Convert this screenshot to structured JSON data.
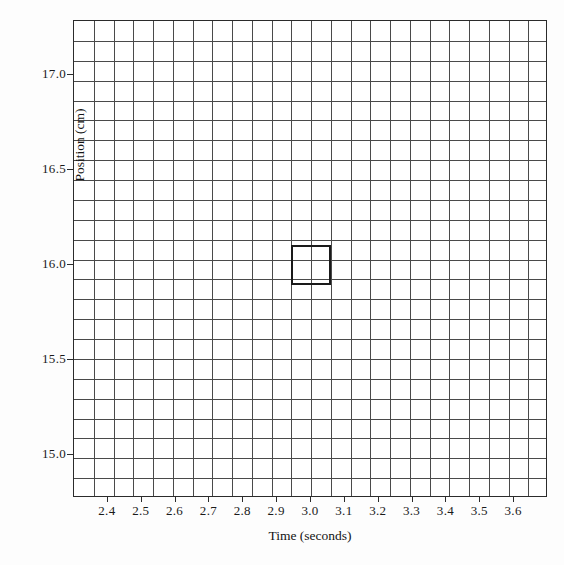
{
  "chart_data": {
    "type": "scatter",
    "title": "",
    "xlabel": "Time (seconds)",
    "ylabel": "Position (cm)",
    "xlim": [
      2.3,
      3.7
    ],
    "ylim": [
      14.775,
      17.285
    ],
    "xticks": [
      "2.4",
      "2.5",
      "2.6",
      "2.7",
      "2.8",
      "2.9",
      "3.0",
      "3.1",
      "3.2",
      "3.3",
      "3.4",
      "3.5",
      "3.6"
    ],
    "xtick_values": [
      2.4,
      2.5,
      2.6,
      2.7,
      2.8,
      2.9,
      3.0,
      3.1,
      3.2,
      3.3,
      3.4,
      3.5,
      3.6
    ],
    "yticks": [
      "15.0",
      "15.5",
      "16.0",
      "16.5",
      "17.0"
    ],
    "ytick_values": [
      15.0,
      15.5,
      16.0,
      16.5,
      17.0
    ],
    "grid": true,
    "grid_columns": 24,
    "grid_rows": 24,
    "grid_cell_width_seconds": 0.0583,
    "grid_cell_height_cm": 0.1046,
    "legend": null,
    "series": [
      {
        "name": "highlighted cell",
        "marker": "open-square",
        "x": [
          3.0
        ],
        "y": [
          16.0
        ],
        "width_seconds": 0.1167,
        "height_cm": 0.2092,
        "color": "#1a1a1a"
      }
    ],
    "annotations": [
      {
        "kind": "bold-rectangle",
        "center_x": 3.0,
        "center_y": 16.0,
        "x_range": [
          2.9417,
          3.0583
        ],
        "y_range": [
          15.8954,
          16.1046
        ]
      }
    ],
    "colors": {
      "gridline": "#4a4a4a",
      "frame": "#2b2b2b",
      "highlight": "#1a1a1a",
      "background": "#ffffff"
    }
  }
}
